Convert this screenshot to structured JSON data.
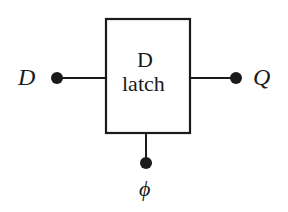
{
  "diagram": {
    "block": {
      "line1": "D",
      "line2": "latch"
    },
    "inputs": {
      "data": "D",
      "clock": "ϕ"
    },
    "outputs": {
      "q": "Q"
    },
    "colors": {
      "stroke": "#1a1a1a",
      "background": "#ffffff"
    }
  }
}
